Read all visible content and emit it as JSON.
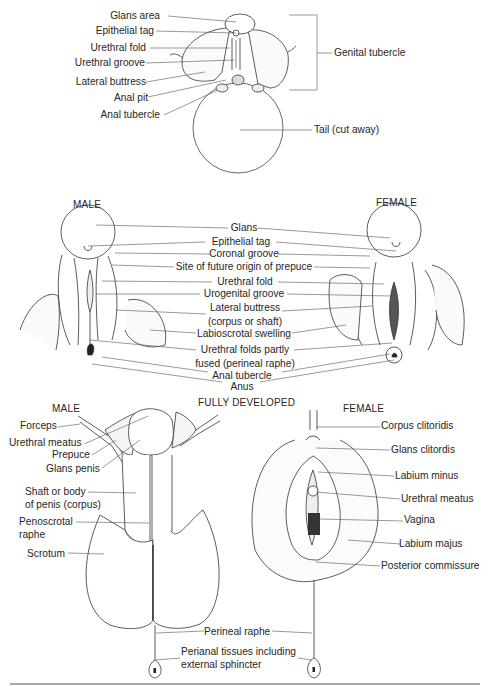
{
  "panel_top": {
    "labels": {
      "glans_area": "Glans area",
      "epithelial_tag": "Epithelial tag",
      "urethral_fold": "Urethral fold",
      "urethral_groove": "Urethral groove",
      "lateral_buttress": "Lateral buttress",
      "anal_pit": "Anal pit",
      "anal_tubercle": "Anal tubercle",
      "genital_tubercle": "Genital tubercle",
      "tail": "Tail (cut away)"
    }
  },
  "panel_middle": {
    "male_heading": "MALE",
    "female_heading": "FEMALE",
    "labels": {
      "glans": "Glans",
      "epithelial_tag": "Epithelial tag",
      "coronal_groove": "Coronal groove",
      "prepuce_site": "Site of future origin of prepuce",
      "urethral_fold": "Urethral fold",
      "urogenital_groove": "Urogenital groove",
      "lateral_buttress_1": "Lateral buttress",
      "lateral_buttress_2": "(corpus or shaft)",
      "labioscrotal": "Labioscrotal swelling",
      "urethral_folds_1": "Urethral folds partly",
      "urethral_folds_2": "fused (perineal raphe)",
      "anal_tubercle": "Anal tubercle",
      "anus": "Anus"
    }
  },
  "panel_bottom": {
    "male_heading": "MALE",
    "center_heading": "FULLY DEVELOPED",
    "female_heading": "FEMALE",
    "male_labels": {
      "forceps": "Forceps",
      "urethral_meatus": "Urethral meatus",
      "prepuce": "Prepuce",
      "glans_penis": "Glans penis",
      "shaft_1": "Shaft or body",
      "shaft_2": "of penis (corpus)",
      "penoscrotal_1": "Penoscrotal",
      "penoscrotal_2": "raphe",
      "scrotum": "Scrotum"
    },
    "female_labels": {
      "corpus_clitoridis": "Corpus clitoridis",
      "glans_clitoridis": "Glans clitordis",
      "labium_minus": "Labium minus",
      "urethral_meatus": "Urethral meatus",
      "vagina": "Vagina",
      "labium_majus": "Labium majus",
      "posterior_commissure": "Posterior commissure"
    },
    "shared_labels": {
      "perineal_raphe": "Perineal raphe",
      "perianal_1": "Perianal tissues including",
      "perianal_2": "external sphincter"
    }
  }
}
